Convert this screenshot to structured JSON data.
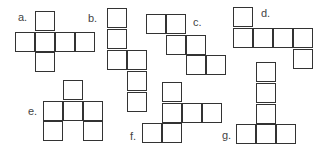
{
  "stroke_color": "#333333",
  "label_color": "#444444",
  "nets": [
    {
      "id": "a",
      "label": "a."
    },
    {
      "id": "b",
      "label": "b."
    },
    {
      "id": "c",
      "label": "c."
    },
    {
      "id": "d",
      "label": "d."
    },
    {
      "id": "e",
      "label": "e."
    },
    {
      "id": "f",
      "label": "f."
    },
    {
      "id": "g",
      "label": "g."
    }
  ]
}
